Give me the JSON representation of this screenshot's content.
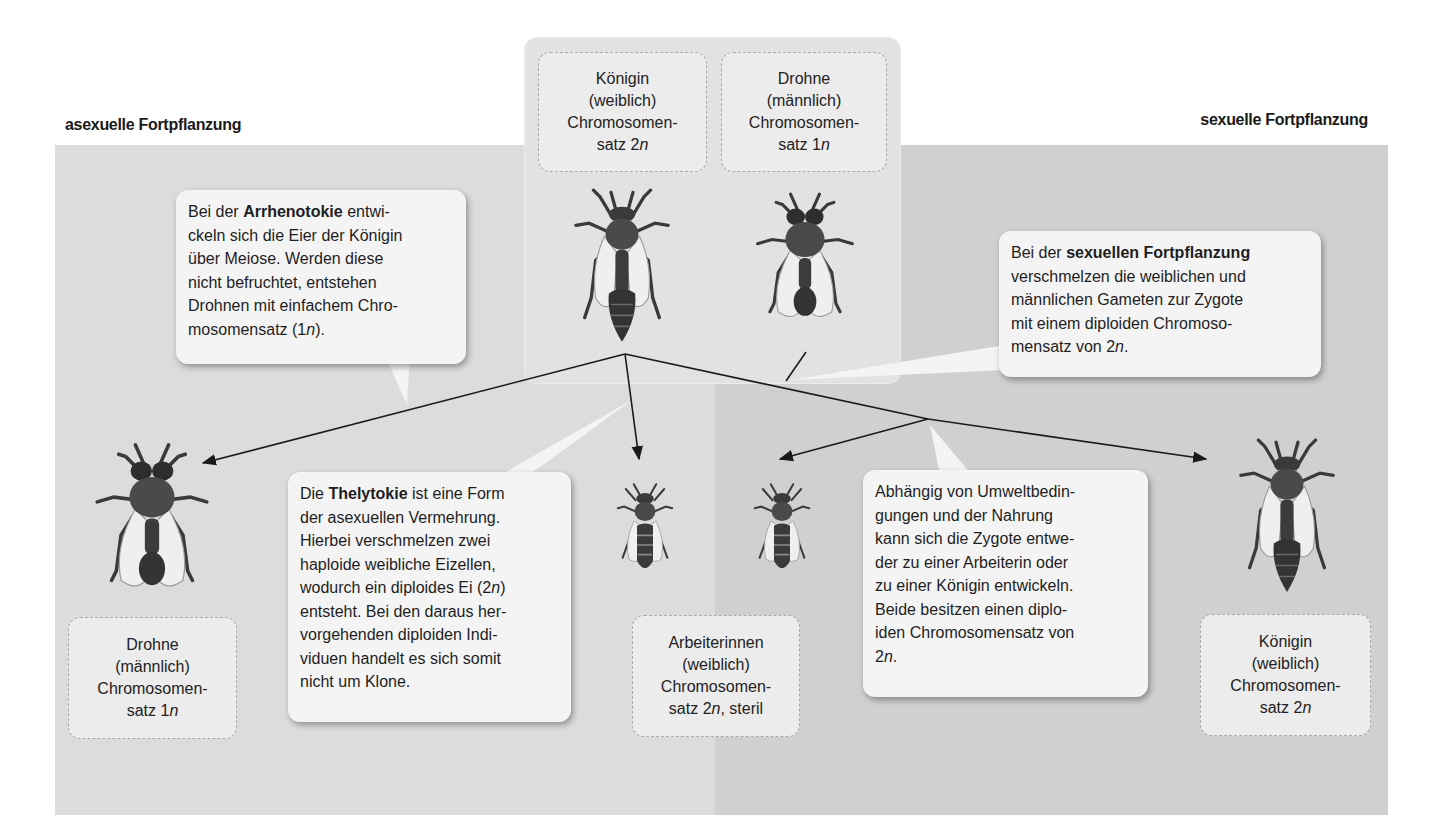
{
  "headings": {
    "asexual": "asexuelle Fortpflanzung",
    "sexual": "sexuelle Fortpflanzung"
  },
  "colors": {
    "panel_left": "#dcdcdc",
    "panel_right": "#d0d0d0",
    "top_box": "#e2e2e2",
    "label_box": "#ececec",
    "bubble": "#f4f4f4",
    "lines": "#1a1a1a"
  },
  "top_labels": {
    "queen": {
      "line1": "Königin",
      "line2": "(weiblich)",
      "line3": "Chromosomen-",
      "line4_prefix": "satz 2",
      "line4_italic": "n",
      "line4_suffix": ""
    },
    "drone": {
      "line1": "Drohne",
      "line2": "(männlich)",
      "line3": "Chromosomen-",
      "line4_prefix": "satz 1",
      "line4_italic": "n",
      "line4_suffix": ""
    }
  },
  "bottom_labels": {
    "drone": {
      "line1": "Drohne",
      "line2": "(männlich)",
      "line3": "Chromosomen-",
      "line4_prefix": "satz 1",
      "line4_italic": "n",
      "line4_suffix": ""
    },
    "workers": {
      "line1": "Arbeiterinnen",
      "line2": "(weiblich)",
      "line3": "Chromosomen-",
      "line4_prefix": "satz 2",
      "line4_italic": "n",
      "line4_suffix": ", steril"
    },
    "queen": {
      "line1": "Königin",
      "line2": "(weiblich)",
      "line3": "Chromosomen-",
      "line4_prefix": "satz 2",
      "line4_italic": "n",
      "line4_suffix": ""
    }
  },
  "bubbles": {
    "arrhenotokie": {
      "pre": "Bei der ",
      "bold": "Arrhenotokie",
      "post1": " entwi-",
      "lines": [
        "ckeln sich die Eier der Königin",
        "über Meiose. Werden diese",
        "nicht befruchtet, entstehen",
        "Drohnen mit einfachem Chro-"
      ],
      "last_prefix": "mosomensatz (1",
      "last_italic": "n",
      "last_suffix": ")."
    },
    "sexual": {
      "pre": "Bei der ",
      "bold": "sexuellen Fortpflanzung",
      "lines": [
        "verschmelzen die weiblichen und",
        "männlichen Gameten zur Zygote",
        "mit einem diploiden Chromoso-"
      ],
      "last_prefix": "mensatz von 2",
      "last_italic": "n",
      "last_suffix": "."
    },
    "thelytokie": {
      "pre": "Die ",
      "bold": "Thelytokie",
      "post1": " ist eine Form",
      "lines_a": [
        "der asexuellen Vermehrung.",
        "Hierbei verschmelzen zwei",
        "haploide weibliche Eizellen,"
      ],
      "line5_prefix": "wodurch ein diploides Ei (2",
      "line5_italic": "n",
      "line5_suffix": ")",
      "lines_b": [
        "entsteht. Bei den daraus her-",
        "vorgehenden diploiden Indi-",
        "viduen handelt es sich somit",
        "nicht um Klone."
      ]
    },
    "environment": {
      "lines": [
        "Abhängig von Umweltbedin-",
        "gungen und der Nahrung",
        "kann sich die Zygote entwe-",
        "der zu einer Arbeiterin oder",
        "zu einer Königin entwickeln.",
        "Beide besitzen einen diplo-",
        "iden Chromosomensatz von"
      ],
      "last_prefix": "2",
      "last_italic": "n",
      "last_suffix": "."
    }
  },
  "bees": [
    {
      "id": "queen-top",
      "type": "queen"
    },
    {
      "id": "drone-top",
      "type": "drone"
    },
    {
      "id": "drone-bottom",
      "type": "drone"
    },
    {
      "id": "worker-asexual",
      "type": "worker"
    },
    {
      "id": "worker-sexual",
      "type": "worker"
    },
    {
      "id": "queen-bottom",
      "type": "queen"
    }
  ]
}
